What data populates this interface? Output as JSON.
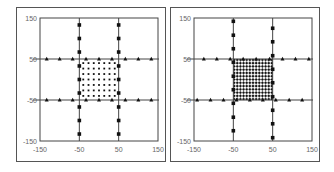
{
  "chart_data": [
    {
      "type": "scatter",
      "panel": "left",
      "title": "",
      "xlabel": "",
      "ylabel": "",
      "xlim": [
        -150,
        150
      ],
      "ylim": [
        -150,
        150
      ],
      "x_ticks": [
        -150,
        -50,
        50,
        150
      ],
      "y_ticks": [
        150,
        50,
        -50,
        -150
      ],
      "grid_lines": {
        "x": [
          -50,
          50
        ],
        "y": [
          -50,
          50
        ]
      },
      "series": [
        {
          "name": "triangles-y50",
          "marker": "triangle",
          "points": [
            [
              -133,
              50
            ],
            [
              -100,
              50
            ],
            [
              -67,
              50
            ],
            [
              -33,
              50
            ],
            [
              0,
              50
            ],
            [
              33,
              50
            ],
            [
              67,
              50
            ],
            [
              100,
              50
            ],
            [
              133,
              50
            ]
          ]
        },
        {
          "name": "triangles-y-50",
          "marker": "triangle",
          "points": [
            [
              -133,
              -50
            ],
            [
              -100,
              -50
            ],
            [
              -67,
              -50
            ],
            [
              -33,
              -50
            ],
            [
              0,
              -50
            ],
            [
              33,
              -50
            ],
            [
              67,
              -50
            ],
            [
              100,
              -50
            ],
            [
              133,
              -50
            ]
          ]
        },
        {
          "name": "squares-x-50",
          "marker": "square",
          "points": [
            [
              -50,
              133
            ],
            [
              -50,
              100
            ],
            [
              -50,
              67
            ],
            [
              -50,
              33
            ],
            [
              -50,
              0
            ],
            [
              -50,
              -33
            ],
            [
              -50,
              -67
            ],
            [
              -50,
              -100
            ],
            [
              -50,
              -133
            ]
          ]
        },
        {
          "name": "squares-x50",
          "marker": "square",
          "points": [
            [
              50,
              133
            ],
            [
              50,
              100
            ],
            [
              50,
              67
            ],
            [
              50,
              33
            ],
            [
              50,
              0
            ],
            [
              50,
              -33
            ],
            [
              50,
              -67
            ],
            [
              50,
              -100
            ],
            [
              50,
              -133
            ]
          ]
        },
        {
          "name": "interior-dots",
          "marker": "dot",
          "grid": {
            "x_from": -40,
            "x_to": 40,
            "y_from": -40,
            "y_to": 40,
            "count": 7
          }
        }
      ]
    },
    {
      "type": "scatter",
      "panel": "right",
      "title": "",
      "xlabel": "",
      "ylabel": "",
      "xlim": [
        -150,
        150
      ],
      "ylim": [
        -150,
        150
      ],
      "x_ticks": [
        -150,
        -50,
        50,
        150
      ],
      "y_ticks": [
        150,
        50,
        -50,
        -150
      ],
      "grid_lines": {
        "x": [
          -50,
          50
        ],
        "y": [
          -50,
          50
        ]
      },
      "series": [
        {
          "name": "triangles-y50",
          "marker": "triangle",
          "points": [
            [
              -125,
              50
            ],
            [
              -92,
              50
            ],
            [
              -58,
              50
            ],
            [
              -25,
              50
            ],
            [
              8,
              50
            ],
            [
              42,
              50
            ],
            [
              75,
              50
            ],
            [
              108,
              50
            ],
            [
              142,
              50
            ]
          ]
        },
        {
          "name": "triangles-y-50",
          "marker": "triangle",
          "points": [
            [
              -142,
              -50
            ],
            [
              -108,
              -50
            ],
            [
              -75,
              -50
            ],
            [
              -42,
              -50
            ],
            [
              -8,
              -50
            ],
            [
              25,
              -50
            ],
            [
              58,
              -50
            ],
            [
              92,
              -50
            ],
            [
              125,
              -50
            ]
          ]
        },
        {
          "name": "squares-x-50",
          "marker": "square",
          "points": [
            [
              -50,
              142
            ],
            [
              -50,
              108
            ],
            [
              -50,
              75
            ],
            [
              -50,
              42
            ],
            [
              -50,
              8
            ],
            [
              -50,
              -25
            ],
            [
              -50,
              -58
            ],
            [
              -50,
              -92
            ],
            [
              -50,
              -125
            ]
          ]
        },
        {
          "name": "squares-x50",
          "marker": "square",
          "points": [
            [
              50,
              125
            ],
            [
              50,
              92
            ],
            [
              50,
              58
            ],
            [
              50,
              25
            ],
            [
              50,
              -8
            ],
            [
              50,
              -42
            ],
            [
              50,
              -75
            ],
            [
              50,
              -108
            ],
            [
              50,
              -142
            ]
          ]
        },
        {
          "name": "interior-dots",
          "marker": "dot",
          "grid": {
            "x_from": -48,
            "x_to": 48,
            "y_from": -48,
            "y_to": 48,
            "count": 13
          }
        }
      ]
    }
  ],
  "panels": [
    {
      "x_labels": [
        "-150",
        "-50",
        "50",
        "150"
      ],
      "y_labels": [
        "150",
        "50",
        "-50",
        "-150"
      ]
    },
    {
      "x_labels": [
        "-150",
        "-50",
        "50",
        "150"
      ],
      "y_labels": [
        "150",
        "50",
        "-50",
        "-150"
      ]
    }
  ],
  "colors": {
    "marker": "#111111",
    "axis": "#444444",
    "label": "#666666",
    "frame": "#555555"
  }
}
